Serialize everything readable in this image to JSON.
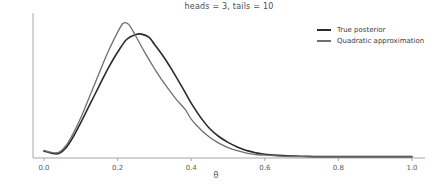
{
  "colors": {
    "axis": "#a6a6a6",
    "tick_label": "#595959",
    "title_text": "#4d4d4d",
    "true_posterior": "#2b2b2b",
    "quadratic_approximation": "#6f6f6f"
  },
  "chart_data": {
    "type": "line",
    "title": "heads = 3, tails = 10",
    "xlabel": "θ",
    "ylabel": "",
    "xlim": [
      -0.03,
      1.04
    ],
    "ylim": [
      0,
      4.2
    ],
    "grid": false,
    "legend_position": "upper right",
    "x_ticks": [
      {
        "value": 0.0,
        "label": "0.0"
      },
      {
        "value": 0.2,
        "label": "0.2"
      },
      {
        "value": 0.4,
        "label": "0.4"
      },
      {
        "value": 0.6,
        "label": "0.6"
      },
      {
        "value": 0.8,
        "label": "0.8"
      },
      {
        "value": 1.0,
        "label": "1.0"
      }
    ],
    "series": [
      {
        "name": "True posterior",
        "color": "#2b2b2b",
        "width": 1.6,
        "peak": {
          "theta": 0.265,
          "density": 3.57
        },
        "points": [
          [
            0.0,
            0.2
          ],
          [
            0.02,
            0.14
          ],
          [
            0.04,
            0.13
          ],
          [
            0.06,
            0.3
          ],
          [
            0.08,
            0.62
          ],
          [
            0.1,
            1.02
          ],
          [
            0.125,
            1.55
          ],
          [
            0.15,
            2.08
          ],
          [
            0.175,
            2.6
          ],
          [
            0.2,
            3.05
          ],
          [
            0.225,
            3.42
          ],
          [
            0.25,
            3.56
          ],
          [
            0.265,
            3.57
          ],
          [
            0.285,
            3.48
          ],
          [
            0.3,
            3.28
          ],
          [
            0.325,
            2.92
          ],
          [
            0.35,
            2.5
          ],
          [
            0.375,
            2.05
          ],
          [
            0.4,
            1.58
          ],
          [
            0.425,
            1.18
          ],
          [
            0.45,
            0.85
          ],
          [
            0.475,
            0.62
          ],
          [
            0.5,
            0.45
          ],
          [
            0.525,
            0.32
          ],
          [
            0.55,
            0.22
          ],
          [
            0.575,
            0.15
          ],
          [
            0.6,
            0.11
          ],
          [
            0.65,
            0.07
          ],
          [
            0.7,
            0.05
          ],
          [
            0.75,
            0.04
          ],
          [
            0.8,
            0.04
          ],
          [
            0.85,
            0.04
          ],
          [
            0.9,
            0.04
          ],
          [
            0.95,
            0.04
          ],
          [
            1.0,
            0.04
          ]
        ]
      },
      {
        "name": "Quadratic approximation",
        "color": "#6f6f6f",
        "width": 1.3,
        "peak": {
          "theta": 0.215,
          "density": 3.88
        },
        "points": [
          [
            0.0,
            0.22
          ],
          [
            0.02,
            0.16
          ],
          [
            0.04,
            0.16
          ],
          [
            0.06,
            0.36
          ],
          [
            0.08,
            0.72
          ],
          [
            0.1,
            1.16
          ],
          [
            0.125,
            1.8
          ],
          [
            0.15,
            2.45
          ],
          [
            0.175,
            3.08
          ],
          [
            0.2,
            3.62
          ],
          [
            0.215,
            3.88
          ],
          [
            0.23,
            3.85
          ],
          [
            0.25,
            3.5
          ],
          [
            0.275,
            3.02
          ],
          [
            0.3,
            2.58
          ],
          [
            0.325,
            2.18
          ],
          [
            0.35,
            1.82
          ],
          [
            0.365,
            1.62
          ],
          [
            0.385,
            1.38
          ],
          [
            0.4,
            1.12
          ],
          [
            0.425,
            0.83
          ],
          [
            0.45,
            0.6
          ],
          [
            0.475,
            0.43
          ],
          [
            0.5,
            0.3
          ],
          [
            0.525,
            0.21
          ],
          [
            0.55,
            0.14
          ],
          [
            0.575,
            0.1
          ],
          [
            0.6,
            0.08
          ],
          [
            0.65,
            0.05
          ],
          [
            0.7,
            0.04
          ],
          [
            0.75,
            0.035
          ],
          [
            0.8,
            0.035
          ],
          [
            0.85,
            0.035
          ],
          [
            0.9,
            0.035
          ],
          [
            0.95,
            0.035
          ],
          [
            1.0,
            0.035
          ]
        ]
      }
    ]
  }
}
